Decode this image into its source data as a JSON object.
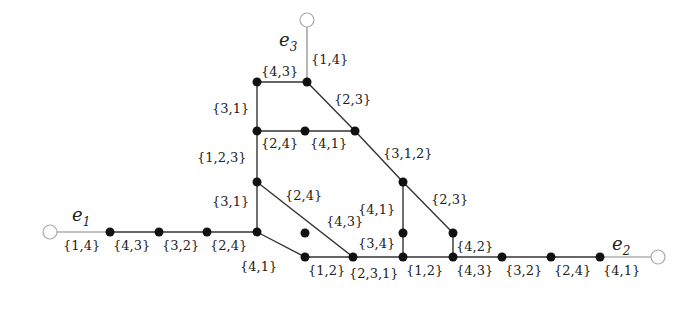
{
  "diagram": {
    "terminals": [
      {
        "id": "e1",
        "name": "e",
        "sub": "1"
      },
      {
        "id": "e2",
        "name": "e",
        "sub": "2"
      },
      {
        "id": "e3",
        "name": "e",
        "sub": "3"
      }
    ],
    "edge_labels": {
      "e3_stub": "{1,4}",
      "top_h": "{4,3}",
      "left_v1": "{3,1}",
      "diag_top": "{2,3}",
      "mid_h1": "{2,4}",
      "mid_h2": "{4,1}",
      "left_v2": "{1,2,3}",
      "diag_mid": "{3,1,2}",
      "left_v3": "{3,1}",
      "diag_a": "{2,4}",
      "diag_b": "{4,3}",
      "v_mid_upper": "{4,1}",
      "v_mid_lower": "{3,4}",
      "diag_right": "{2,3}",
      "v_right": "{4,2}",
      "e1_row": [
        "{1,4}",
        "{4,3}",
        "{3,2}",
        "{2,4}"
      ],
      "diag_low": "{4,1}",
      "bottom_row": [
        "{1,2}",
        "{2,3,1}",
        "{1,2}",
        "{4,3}",
        "{3,2}",
        "{2,4}",
        "{4,1}"
      ]
    }
  }
}
